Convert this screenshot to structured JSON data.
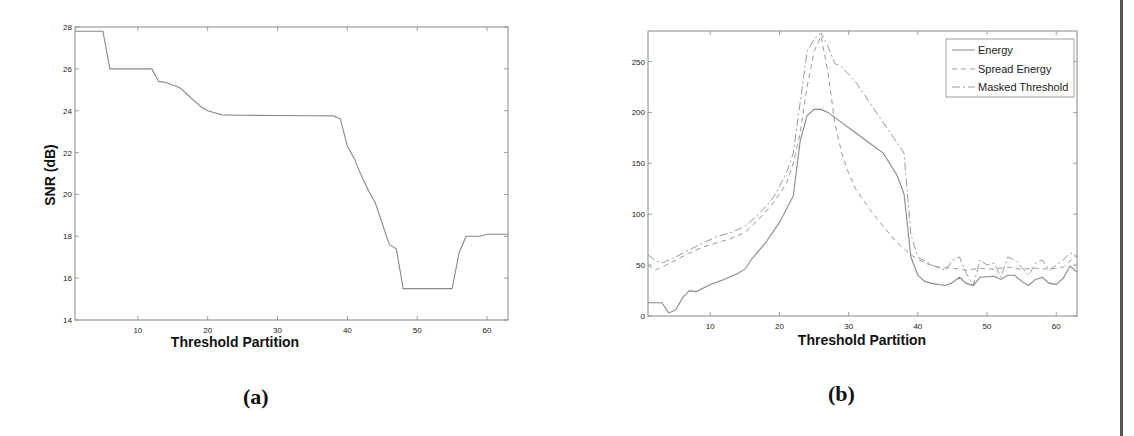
{
  "figure": {
    "panels": [
      {
        "label": "(a)"
      },
      {
        "label": "(b)"
      }
    ]
  },
  "chart_data": [
    {
      "type": "line",
      "panel": "(a)",
      "title": "",
      "xlabel": "Threshold Partition",
      "ylabel": "SNR (dB)",
      "xlim": [
        1,
        63
      ],
      "ylim": [
        14,
        28
      ],
      "xticks": [
        10,
        20,
        30,
        40,
        50,
        60
      ],
      "yticks": [
        14,
        16,
        18,
        20,
        22,
        24,
        26,
        28
      ],
      "grid": false,
      "series": [
        {
          "name": "SNR",
          "style": "solid",
          "x": [
            1,
            5,
            6,
            12,
            13,
            14,
            16,
            17,
            18,
            19,
            20,
            21,
            22,
            25,
            30,
            35,
            38,
            39,
            40,
            41,
            42,
            43,
            44,
            45,
            46,
            47,
            48,
            50,
            55,
            56,
            57,
            58,
            59,
            60,
            61,
            62,
            63
          ],
          "values": [
            27.8,
            27.8,
            26.0,
            26.0,
            25.4,
            25.35,
            25.1,
            24.8,
            24.5,
            24.2,
            24.0,
            23.9,
            23.8,
            23.78,
            23.77,
            23.76,
            23.75,
            23.6,
            22.3,
            21.7,
            20.9,
            20.2,
            19.6,
            18.6,
            17.6,
            17.4,
            15.5,
            15.5,
            15.5,
            17.2,
            18.0,
            18.0,
            18.0,
            18.1,
            18.1,
            18.1,
            18.1
          ]
        }
      ]
    },
    {
      "type": "line",
      "panel": "(b)",
      "title": "",
      "xlabel": "Threshold Partition",
      "ylabel": "",
      "xlim": [
        1,
        63
      ],
      "ylim": [
        0,
        280
      ],
      "xticks": [
        10,
        20,
        30,
        40,
        50,
        60
      ],
      "yticks": [
        0,
        50,
        100,
        150,
        200,
        250
      ],
      "grid": false,
      "legend_position": "upper right",
      "series": [
        {
          "name": "Energy",
          "style": "solid",
          "x": [
            1,
            3,
            4,
            5,
            6,
            7,
            8,
            10,
            12,
            14,
            15,
            16,
            18,
            20,
            22,
            23,
            24,
            25,
            26,
            27,
            29,
            31,
            33,
            35,
            37,
            38,
            39,
            40,
            41,
            42,
            44,
            45,
            46,
            47,
            48,
            49,
            51,
            52,
            53,
            54,
            55,
            56,
            57,
            58,
            59,
            60,
            61,
            62,
            63
          ],
          "values": [
            13,
            13,
            3,
            6,
            18,
            25,
            24,
            31,
            36,
            42,
            46,
            56,
            72,
            92,
            118,
            172,
            197,
            203,
            203,
            200,
            190,
            180,
            170,
            160,
            138,
            120,
            58,
            40,
            34,
            32,
            30,
            33,
            38,
            32,
            30,
            38,
            39,
            36,
            40,
            40,
            34,
            30,
            36,
            38,
            32,
            31,
            37,
            49,
            43
          ]
        },
        {
          "name": "Spread Energy",
          "style": "dashed",
          "x": [
            1,
            2,
            3,
            5,
            7,
            9,
            11,
            13,
            15,
            17,
            19,
            21,
            22,
            23,
            24,
            25,
            26,
            27,
            28,
            29,
            30,
            31,
            33,
            35,
            37,
            39,
            41,
            43,
            45,
            47,
            49,
            51,
            53,
            55,
            57,
            59,
            61,
            63
          ],
          "values": [
            50,
            45,
            48,
            55,
            62,
            68,
            72,
            76,
            82,
            95,
            110,
            130,
            150,
            180,
            225,
            260,
            275,
            240,
            190,
            160,
            140,
            125,
            105,
            88,
            72,
            60,
            52,
            48,
            47,
            45,
            47,
            46,
            48,
            46,
            47,
            46,
            48,
            60
          ]
        },
        {
          "name": "Masked Threshold",
          "style": "dash-dot",
          "x": [
            1,
            2,
            3,
            5,
            7,
            9,
            11,
            13,
            15,
            17,
            19,
            21,
            22,
            23,
            24,
            25,
            26,
            27,
            28,
            29,
            31,
            33,
            35,
            37,
            38,
            39,
            40,
            42,
            44,
            45,
            46,
            47,
            48,
            49,
            50,
            51,
            52,
            53,
            54,
            55,
            56,
            57,
            58,
            59,
            60,
            61,
            62,
            63
          ],
          "values": [
            60,
            55,
            52,
            58,
            65,
            72,
            78,
            82,
            88,
            100,
            115,
            140,
            160,
            210,
            260,
            272,
            278,
            265,
            248,
            245,
            230,
            210,
            190,
            170,
            160,
            80,
            58,
            50,
            45,
            55,
            58,
            42,
            30,
            55,
            50,
            52,
            38,
            58,
            55,
            48,
            40,
            52,
            55,
            45,
            50,
            55,
            62,
            58
          ]
        }
      ]
    }
  ]
}
